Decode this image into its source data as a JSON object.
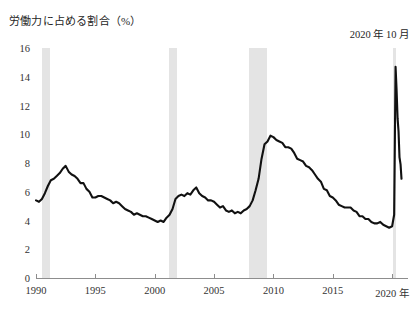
{
  "chart": {
    "title": "労働力に占める割合（%）",
    "annotation": "2020 年 10 月",
    "year_suffix": "年"
  },
  "chart_data": {
    "type": "line",
    "title": "労働力に占める割合（%）",
    "xlabel": "年",
    "ylabel": "労働力に占める割合（%）",
    "xlim": [
      1990,
      2021
    ],
    "ylim": [
      0,
      16
    ],
    "ytick_labels": [
      "0",
      "2",
      "4",
      "6",
      "8",
      "10",
      "12",
      "14",
      "16"
    ],
    "yticks": [
      0,
      2,
      4,
      6,
      8,
      10,
      12,
      14,
      16
    ],
    "xtick_labels": [
      "1990",
      "1995",
      "2000",
      "2005",
      "2010",
      "2015",
      "2020"
    ],
    "xticks": [
      1990,
      1995,
      2000,
      2005,
      2010,
      2015,
      2020
    ],
    "grid": false,
    "legend": null,
    "annotations": [
      {
        "text": "2020 年 10 月",
        "x": 2020.79,
        "y": 6.9,
        "position": "top-right"
      }
    ],
    "shaded_bands": [
      {
        "label": "recession-1990-1991",
        "x0": 1990.5,
        "x1": 1991.2
      },
      {
        "label": "recession-2001",
        "x0": 2001.2,
        "x1": 2001.9
      },
      {
        "label": "recession-2007-2009",
        "x0": 2007.95,
        "x1": 2009.5
      },
      {
        "label": "recession-2020",
        "x0": 2020.1,
        "x1": 2020.35
      }
    ],
    "series": [
      {
        "name": "失業率",
        "color": "#111111",
        "x": [
          1990.0,
          1990.25,
          1990.5,
          1990.75,
          1991.0,
          1991.25,
          1991.5,
          1991.75,
          1992.0,
          1992.25,
          1992.5,
          1992.75,
          1993.0,
          1993.25,
          1993.5,
          1993.75,
          1994.0,
          1994.25,
          1994.5,
          1994.75,
          1995.0,
          1995.25,
          1995.5,
          1995.75,
          1996.0,
          1996.25,
          1996.5,
          1996.75,
          1997.0,
          1997.25,
          1997.5,
          1997.75,
          1998.0,
          1998.25,
          1998.5,
          1998.75,
          1999.0,
          1999.25,
          1999.5,
          1999.75,
          2000.0,
          2000.25,
          2000.5,
          2000.75,
          2001.0,
          2001.25,
          2001.5,
          2001.75,
          2002.0,
          2002.25,
          2002.5,
          2002.75,
          2003.0,
          2003.25,
          2003.5,
          2003.75,
          2004.0,
          2004.25,
          2004.5,
          2004.75,
          2005.0,
          2005.25,
          2005.5,
          2005.75,
          2006.0,
          2006.25,
          2006.5,
          2006.75,
          2007.0,
          2007.25,
          2007.5,
          2007.75,
          2008.0,
          2008.25,
          2008.5,
          2008.75,
          2009.0,
          2009.25,
          2009.5,
          2009.75,
          2010.0,
          2010.25,
          2010.5,
          2010.75,
          2011.0,
          2011.25,
          2011.5,
          2011.75,
          2012.0,
          2012.25,
          2012.5,
          2012.75,
          2013.0,
          2013.25,
          2013.5,
          2013.75,
          2014.0,
          2014.25,
          2014.5,
          2014.75,
          2015.0,
          2015.25,
          2015.5,
          2015.75,
          2016.0,
          2016.25,
          2016.5,
          2016.75,
          2017.0,
          2017.25,
          2017.5,
          2017.75,
          2018.0,
          2018.25,
          2018.5,
          2018.75,
          2019.0,
          2019.25,
          2019.5,
          2019.75,
          2020.0,
          2020.17,
          2020.29,
          2020.37,
          2020.46,
          2020.54,
          2020.62,
          2020.71,
          2020.79
        ],
        "y": [
          5.4,
          5.3,
          5.5,
          5.9,
          6.4,
          6.8,
          6.9,
          7.1,
          7.3,
          7.6,
          7.8,
          7.4,
          7.2,
          7.1,
          6.9,
          6.6,
          6.6,
          6.2,
          6.0,
          5.6,
          5.6,
          5.7,
          5.7,
          5.6,
          5.5,
          5.4,
          5.2,
          5.3,
          5.2,
          5.0,
          4.8,
          4.7,
          4.6,
          4.4,
          4.5,
          4.4,
          4.3,
          4.3,
          4.2,
          4.1,
          4.0,
          3.9,
          4.0,
          3.9,
          4.2,
          4.4,
          4.8,
          5.5,
          5.7,
          5.8,
          5.7,
          5.9,
          5.8,
          6.1,
          6.3,
          5.9,
          5.7,
          5.6,
          5.4,
          5.4,
          5.3,
          5.1,
          4.9,
          5.0,
          4.7,
          4.6,
          4.7,
          4.5,
          4.6,
          4.5,
          4.7,
          4.8,
          5.0,
          5.4,
          6.1,
          6.9,
          8.3,
          9.3,
          9.5,
          9.9,
          9.8,
          9.6,
          9.5,
          9.4,
          9.1,
          9.1,
          9.0,
          8.7,
          8.3,
          8.2,
          8.1,
          7.8,
          7.7,
          7.5,
          7.2,
          6.9,
          6.7,
          6.2,
          6.1,
          5.7,
          5.6,
          5.4,
          5.1,
          5.0,
          4.9,
          4.9,
          4.9,
          4.7,
          4.6,
          4.3,
          4.3,
          4.1,
          4.1,
          3.9,
          3.8,
          3.8,
          3.9,
          3.7,
          3.6,
          3.5,
          3.6,
          4.4,
          14.7,
          13.2,
          11.1,
          10.2,
          8.4,
          7.9,
          6.9
        ]
      }
    ]
  }
}
